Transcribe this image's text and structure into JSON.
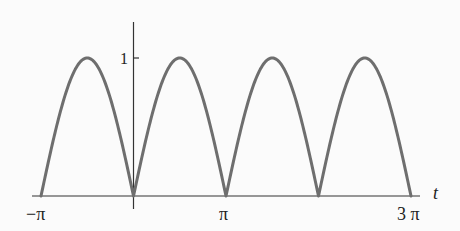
{
  "chart_data": {
    "type": "line",
    "title": "",
    "function": "|sin t|",
    "xlabel": "t",
    "ylabel": "",
    "xlim": [
      -3.14159,
      9.42478
    ],
    "ylim": [
      0,
      1
    ],
    "grid": false,
    "legend": null,
    "x_tick_labels": [
      "−π",
      "π",
      "3 π"
    ],
    "x_ticks": [
      -3.14159,
      3.14159,
      9.42478
    ],
    "y_tick_labels": [
      "1"
    ],
    "y_ticks": [
      1
    ],
    "series": [
      {
        "name": "|sin t|",
        "color": "#6e6e6e",
        "x": [
          -3.14159,
          -2.35619,
          -1.5708,
          -0.7854,
          0,
          0.7854,
          1.5708,
          2.35619,
          3.14159,
          3.92699,
          4.71239,
          5.49779,
          6.28319,
          7.06858,
          7.85398,
          8.63938,
          9.42478
        ],
        "values": [
          0,
          0.707,
          1,
          0.707,
          0,
          0.707,
          1,
          0.707,
          0,
          0.707,
          1,
          0.707,
          0,
          0.707,
          1,
          0.707,
          0
        ]
      }
    ]
  },
  "labels": {
    "x_axis_var": "t",
    "tick_neg_pi": "−π",
    "tick_pi": "π",
    "tick_3pi": "3 π",
    "tick_y_one": "1"
  },
  "colors": {
    "axis": "#333333",
    "curve": "#6e6e6e",
    "background": "#fbfbfb"
  }
}
